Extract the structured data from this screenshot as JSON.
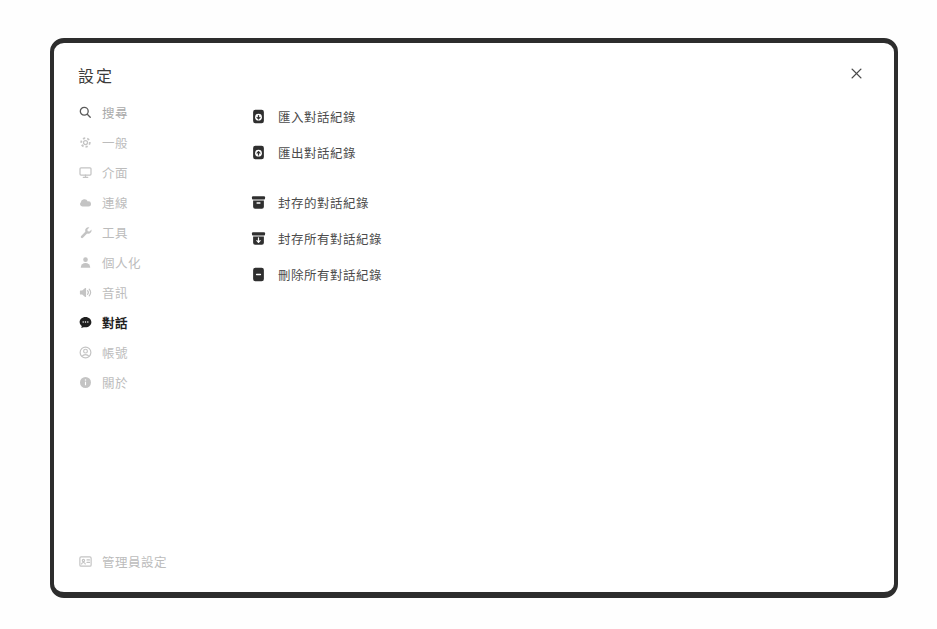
{
  "modal": {
    "title": "設定",
    "close_label": "×"
  },
  "sidebar": {
    "search": {
      "placeholder": "搜尋"
    },
    "items": [
      {
        "label": "一般",
        "icon": "gear-icon",
        "active": false
      },
      {
        "label": "介面",
        "icon": "monitor-icon",
        "active": false
      },
      {
        "label": "連線",
        "icon": "cloud-icon",
        "active": false
      },
      {
        "label": "工具",
        "icon": "wrench-icon",
        "active": false
      },
      {
        "label": "個人化",
        "icon": "person-icon",
        "active": false
      },
      {
        "label": "音訊",
        "icon": "speaker-icon",
        "active": false
      },
      {
        "label": "對話",
        "icon": "chat-bubble-icon",
        "active": true
      },
      {
        "label": "帳號",
        "icon": "user-circle-icon",
        "active": false
      },
      {
        "label": "關於",
        "icon": "info-icon",
        "active": false
      }
    ],
    "admin_settings": {
      "label": "管理員設定",
      "icon": "id-badge-icon"
    }
  },
  "content": {
    "actions": [
      {
        "label": "匯入對話紀錄",
        "icon": "document-arrow-down-icon"
      },
      {
        "label": "匯出對話紀錄",
        "icon": "document-arrow-up-icon"
      },
      {
        "label": "封存的對話紀錄",
        "icon": "archive-box-icon"
      },
      {
        "label": "封存所有對話紀錄",
        "icon": "archive-box-arrow-icon"
      },
      {
        "label": "刪除所有對話紀錄",
        "icon": "document-minus-icon"
      }
    ]
  },
  "colors": {
    "modal_border": "#2d2d2d",
    "title_text": "#3c3c3c",
    "inactive_text": "#bcbcbc",
    "active_text": "#1f1f1f",
    "content_text": "#4b4b4b",
    "icon_dark": "#2f2f2f",
    "placeholder_text": "#a9a9a9"
  }
}
